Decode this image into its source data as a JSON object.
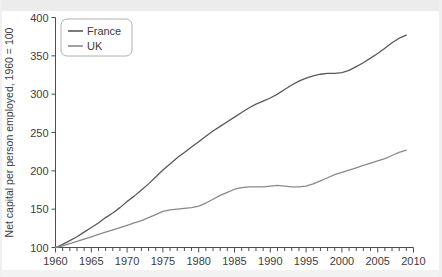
{
  "chart_data": {
    "type": "line",
    "title": "",
    "subtitle": "",
    "xlabel": "",
    "ylabel": "Net capital per person employed, 1960 = 100",
    "xlim": [
      1960,
      2010
    ],
    "ylim": [
      100,
      400
    ],
    "ytick_labels": [
      "100",
      "150",
      "200",
      "250",
      "300",
      "350",
      "400"
    ],
    "ytick_values": [
      100,
      150,
      200,
      250,
      300,
      350,
      400
    ],
    "xtick_labels": [
      "1960",
      "1965",
      "1970",
      "1975",
      "1980",
      "1985",
      "1990",
      "1995",
      "2000",
      "2005",
      "2010"
    ],
    "xtick_values": [
      1960,
      1965,
      1970,
      1975,
      1980,
      1985,
      1990,
      1995,
      2000,
      2005,
      2010
    ],
    "xminor_step": 1,
    "grid": false,
    "legend_position": "top-left",
    "x": [
      1960,
      1961,
      1962,
      1963,
      1964,
      1965,
      1966,
      1967,
      1968,
      1969,
      1970,
      1971,
      1972,
      1973,
      1974,
      1975,
      1976,
      1977,
      1978,
      1979,
      1980,
      1981,
      1982,
      1983,
      1984,
      1985,
      1986,
      1987,
      1988,
      1989,
      1990,
      1991,
      1992,
      1993,
      1994,
      1995,
      1996,
      1997,
      1998,
      1999,
      2000,
      2001,
      2002,
      2003,
      2004,
      2005,
      2006,
      2007,
      2008,
      2009
    ],
    "series": [
      {
        "name": "France",
        "color": "#595959",
        "values": [
          100,
          104,
          109,
          114,
          120,
          126,
          132,
          139,
          145,
          152,
          160,
          167,
          175,
          183,
          192,
          201,
          209,
          217,
          224,
          231,
          238,
          245,
          252,
          258,
          264,
          270,
          276,
          282,
          287,
          291,
          295,
          300,
          306,
          312,
          317,
          321,
          324,
          326,
          327,
          327,
          328,
          331,
          336,
          341,
          347,
          353,
          360,
          367,
          373,
          377
        ]
      },
      {
        "name": "UK",
        "color": "#8a8a8a",
        "values": [
          100,
          102,
          105,
          108,
          111,
          114,
          117,
          120,
          123,
          126,
          129,
          132,
          135,
          139,
          143,
          147,
          149,
          150,
          151,
          152,
          154,
          158,
          163,
          168,
          172,
          176,
          178,
          179,
          179,
          179,
          180,
          181,
          180,
          179,
          179,
          180,
          183,
          187,
          191,
          195,
          198,
          201,
          204,
          207,
          210,
          213,
          216,
          220,
          224,
          227
        ]
      }
    ]
  },
  "legend": {
    "items": [
      {
        "label": "France"
      },
      {
        "label": "UK"
      }
    ]
  }
}
